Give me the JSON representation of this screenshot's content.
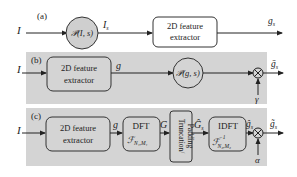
{
  "colors": {
    "panel_background": "#d4d4d4",
    "circle_fill_a": "#cfcfcf",
    "block_fill": "#d4d4d4",
    "stroke": "#333333",
    "page_background": "#ffffff"
  },
  "panels": [
    {
      "label": "(a)",
      "input": "I",
      "blocks": [
        {
          "type": "circle",
          "label": "𝒫(I, s)"
        },
        {
          "type": "box",
          "label_line1": "2D feature",
          "label_line2": "extractor"
        }
      ],
      "signals": [
        "I_s"
      ],
      "signal_display": {
        "is_main": "I",
        "is_sub": "s"
      },
      "output": {
        "main": "g",
        "sub": "s"
      }
    },
    {
      "label": "(b)",
      "input": "I",
      "blocks": [
        {
          "type": "box",
          "label_line1": "2D feature",
          "label_line2": "extractor"
        },
        {
          "type": "circle",
          "label": "𝒫(g, s)"
        },
        {
          "type": "multiplier",
          "label": "⊗"
        }
      ],
      "signals": [
        "g"
      ],
      "multiplier_input": "γ",
      "output": {
        "main": "ḡ",
        "sub": "s"
      }
    },
    {
      "label": "(c)",
      "input": "I",
      "blocks": [
        {
          "type": "box",
          "label_line1": "2D feature",
          "label_line2": "extractor"
        },
        {
          "type": "box",
          "label_line1": "DFT",
          "label_line2": "ℱ",
          "sub2": "N₁,M₁"
        },
        {
          "type": "box-vertical",
          "label_line1": "Truncation/",
          "label_line2": "Padding"
        },
        {
          "type": "box",
          "label_line1": "IDFT",
          "label_line2": "ℱ",
          "sup2": "−1",
          "sub2": "N₂,M₂"
        },
        {
          "type": "multiplier",
          "label": "⊗"
        }
      ],
      "signals": [
        "g",
        "G",
        "Ĝ_s",
        "ĝ_s"
      ],
      "signal_display": {
        "g": "g",
        "G": "G",
        "G_hat_main": "Ĝ",
        "G_hat_sub": "s",
        "g_hat_main": "ĝ",
        "g_hat_sub": "s"
      },
      "multiplier_input": "α",
      "output": {
        "main": "g̃",
        "sub": "s"
      }
    }
  ]
}
